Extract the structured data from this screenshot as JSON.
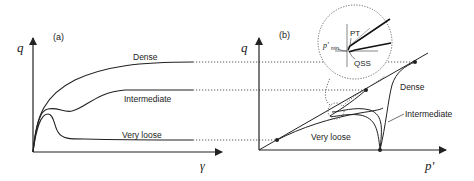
{
  "panel_a": {
    "tag": "(a)",
    "y_axis_label": "q",
    "x_axis_label": "γ",
    "curves": [
      {
        "name": "Dense",
        "label": "Dense"
      },
      {
        "name": "Intermediate",
        "label": "Intermediate"
      },
      {
        "name": "Very loose",
        "label": "Very loose"
      }
    ]
  },
  "panel_b": {
    "tag": "(b)",
    "y_axis_label": "q",
    "x_axis_label": "p'",
    "curves": [
      {
        "name": "Dense",
        "label": "Dense"
      },
      {
        "name": "Intermediate",
        "label": "Intermediate"
      },
      {
        "name": "Very loose",
        "label": "Very loose"
      }
    ],
    "inset": {
      "pt_label": "PT",
      "qss_label": "QSS",
      "pmin_label": "p'",
      "pmin_sub": "min"
    }
  },
  "colors": {
    "line": "#222222",
    "dotted": "#444444",
    "background": "#ffffff"
  }
}
